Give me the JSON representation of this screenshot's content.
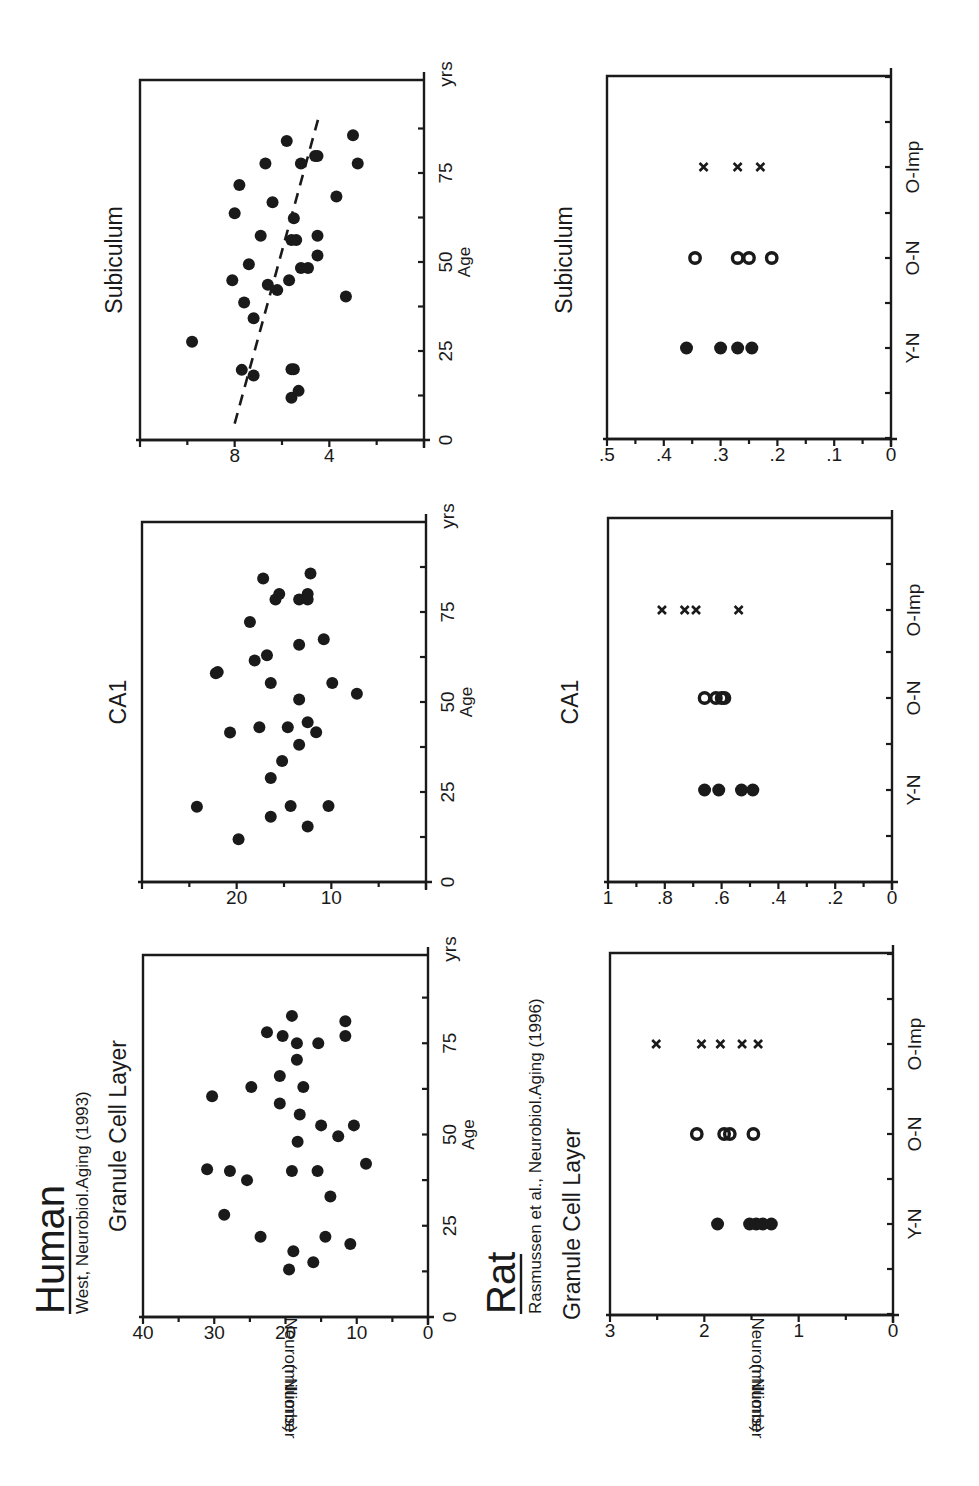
{
  "figure": {
    "sections": [
      {
        "species": "Human",
        "citation": "West, Neurobiol.Aging (1993)"
      },
      {
        "species": "Rat",
        "citation": "Rasmussen et al., Neurobiol.Aging (1996)"
      }
    ],
    "ylabel_line1": "Neuron Number",
    "ylabel_line2": "(millions)",
    "age_label": "Age",
    "age_unit": "yrs"
  },
  "chart_data": [
    {
      "id": "human-gcl",
      "type": "scatter",
      "title": "Granule Cell Layer",
      "xlabel": "Age",
      "ylabel": "Neuron Number (millions)",
      "xlim": [
        0,
        99
      ],
      "ylim": [
        0,
        40
      ],
      "xticks": [
        0,
        25,
        50,
        75
      ],
      "yticks": [
        0,
        10,
        20,
        30,
        40
      ],
      "x_end_label": "yrs",
      "points": [
        [
          13,
          19.5
        ],
        [
          18,
          18.9
        ],
        [
          15,
          16.1
        ],
        [
          22,
          23.5
        ],
        [
          22,
          14.4
        ],
        [
          20,
          10.9
        ],
        [
          28,
          28.6
        ],
        [
          33,
          13.7
        ],
        [
          37.5,
          25.4
        ],
        [
          40.5,
          31.0
        ],
        [
          40,
          27.8
        ],
        [
          40,
          19.1
        ],
        [
          40,
          15.5
        ],
        [
          42,
          8.7
        ],
        [
          48,
          18.3
        ],
        [
          49.5,
          12.6
        ],
        [
          52.5,
          15.0
        ],
        [
          52.5,
          10.4
        ],
        [
          55.5,
          18.0
        ],
        [
          58.5,
          20.8
        ],
        [
          60.5,
          30.3
        ],
        [
          63,
          24.8
        ],
        [
          63,
          17.5
        ],
        [
          66,
          20.8
        ],
        [
          70.5,
          18.4
        ],
        [
          75,
          18.4
        ],
        [
          75,
          15.4
        ],
        [
          77,
          20.4
        ],
        [
          77,
          11.6
        ],
        [
          78,
          22.6
        ],
        [
          81,
          11.6
        ],
        [
          82.5,
          19.1
        ]
      ]
    },
    {
      "id": "human-ca1",
      "type": "scatter",
      "title": "CA1",
      "xlabel": "Age",
      "ylabel": "Neuron Number (millions)",
      "xlim": [
        0,
        100
      ],
      "ylim": [
        0,
        30
      ],
      "xticks": [
        0,
        25,
        50,
        75
      ],
      "yticks": [
        10,
        20
      ],
      "x_end_label": "yrs",
      "points": [
        [
          11.9,
          19.8
        ],
        [
          20.9,
          24.2
        ],
        [
          18.1,
          16.4
        ],
        [
          21.1,
          14.3
        ],
        [
          15.4,
          12.5
        ],
        [
          21.1,
          10.3
        ],
        [
          28.9,
          16.4
        ],
        [
          33.6,
          15.2
        ],
        [
          38.1,
          13.4
        ],
        [
          41.5,
          20.7
        ],
        [
          43,
          17.6
        ],
        [
          43,
          14.6
        ],
        [
          44.4,
          12.5
        ],
        [
          41.6,
          11.6
        ],
        [
          50.7,
          13.4
        ],
        [
          52.3,
          7.3
        ],
        [
          55.3,
          9.9
        ],
        [
          55.3,
          16.4
        ],
        [
          58,
          22.2
        ],
        [
          58.3,
          22.0
        ],
        [
          61.5,
          18.1
        ],
        [
          63,
          16.8
        ],
        [
          65.9,
          13.4
        ],
        [
          67.4,
          10.8
        ],
        [
          72.2,
          18.6
        ],
        [
          78.5,
          15.9
        ],
        [
          80,
          15.5
        ],
        [
          78.5,
          13.4
        ],
        [
          80,
          12.5
        ],
        [
          78.5,
          12.5
        ],
        [
          84.3,
          17.2
        ],
        [
          85.7,
          12.2
        ]
      ]
    },
    {
      "id": "human-subiculum",
      "type": "scatter",
      "title": "Subiculum",
      "xlabel": "Age",
      "ylabel": "Neuron Number (millions)",
      "xlim": [
        0,
        101
      ],
      "ylim": [
        0,
        12
      ],
      "xticks": [
        0,
        25,
        50,
        75
      ],
      "yticks": [
        4,
        8
      ],
      "x_end_label": "yrs",
      "trendline": {
        "style": "dashed",
        "from": [
          4.6,
          8.0
        ],
        "to": [
          91.9,
          4.4
        ]
      },
      "points": [
        [
          27.6,
          9.8
        ],
        [
          19.7,
          7.7
        ],
        [
          18.1,
          7.2
        ],
        [
          19.9,
          5.6
        ],
        [
          19.9,
          5.5
        ],
        [
          11.9,
          5.6
        ],
        [
          13.8,
          5.3
        ],
        [
          34.2,
          7.2
        ],
        [
          38.6,
          7.6
        ],
        [
          44.9,
          8.1
        ],
        [
          49.4,
          7.4
        ],
        [
          43.6,
          6.6
        ],
        [
          42.1,
          6.2
        ],
        [
          44.9,
          5.7
        ],
        [
          40.3,
          3.3
        ],
        [
          48.3,
          5.2
        ],
        [
          48.3,
          4.9
        ],
        [
          51.8,
          4.5
        ],
        [
          56.2,
          5.6
        ],
        [
          56.2,
          5.4
        ],
        [
          57.4,
          4.5
        ],
        [
          57.4,
          6.9
        ],
        [
          62.3,
          5.5
        ],
        [
          63.7,
          8.0
        ],
        [
          66.8,
          6.4
        ],
        [
          68.4,
          3.7
        ],
        [
          71.6,
          7.8
        ],
        [
          77.7,
          6.7
        ],
        [
          77.7,
          5.2
        ],
        [
          77.7,
          2.8
        ],
        [
          79.8,
          4.6
        ],
        [
          79.8,
          4.5
        ],
        [
          84,
          5.8
        ],
        [
          85.6,
          3.0
        ]
      ]
    },
    {
      "id": "rat-gcl",
      "type": "scatter",
      "title": "Granule Cell Layer",
      "xlabel": "",
      "ylabel": "Neuron Number (millions)",
      "ylim": [
        0,
        3
      ],
      "yticks": [
        0,
        1,
        2,
        3
      ],
      "ytick_labels": [
        "0",
        "1",
        "2",
        "3"
      ],
      "categories": [
        "Y-N",
        "O-N",
        "O-Imp"
      ],
      "series": [
        {
          "name": "Y-N",
          "marker": "filled-circle",
          "values": [
            1.86,
            1.52,
            1.45,
            1.38,
            1.29
          ]
        },
        {
          "name": "O-N",
          "marker": "open-circle",
          "values": [
            2.08,
            1.79,
            1.73,
            1.48
          ]
        },
        {
          "name": "O-Imp",
          "marker": "x",
          "values": [
            2.51,
            2.03,
            1.83,
            1.6,
            1.43
          ]
        }
      ]
    },
    {
      "id": "rat-ca1",
      "type": "scatter",
      "title": "CA1",
      "xlabel": "",
      "ylabel": "Neuron Number (millions)",
      "ylim": [
        0,
        1
      ],
      "yticks": [
        0,
        0.2,
        0.4,
        0.6,
        0.8,
        1
      ],
      "ytick_labels": [
        "0",
        ".2",
        ".4",
        ".6",
        ".8",
        "1"
      ],
      "categories": [
        "Y-N",
        "O-N",
        "O-Imp"
      ],
      "series": [
        {
          "name": "Y-N",
          "marker": "filled-circle",
          "values": [
            0.66,
            0.61,
            0.53,
            0.49
          ]
        },
        {
          "name": "O-N",
          "marker": "open-circle",
          "values": [
            0.66,
            0.62,
            0.6,
            0.59
          ]
        },
        {
          "name": "O-Imp",
          "marker": "x",
          "values": [
            0.81,
            0.73,
            0.69,
            0.54
          ]
        }
      ]
    },
    {
      "id": "rat-subiculum",
      "type": "scatter",
      "title": "Subiculum",
      "xlabel": "",
      "ylabel": "Neuron Number (millions)",
      "ylim": [
        0,
        0.5
      ],
      "yticks": [
        0,
        0.1,
        0.2,
        0.3,
        0.4,
        0.5
      ],
      "ytick_labels": [
        "0",
        ".1",
        ".2",
        ".3",
        ".4",
        ".5"
      ],
      "categories": [
        "Y-N",
        "O-N",
        "O-Imp"
      ],
      "series": [
        {
          "name": "Y-N",
          "marker": "filled-circle",
          "values": [
            0.36,
            0.3,
            0.27,
            0.245
          ]
        },
        {
          "name": "O-N",
          "marker": "open-circle",
          "values": [
            0.345,
            0.27,
            0.25,
            0.21
          ]
        },
        {
          "name": "O-Imp",
          "marker": "x",
          "values": [
            0.33,
            0.27,
            0.23
          ]
        }
      ]
    }
  ]
}
